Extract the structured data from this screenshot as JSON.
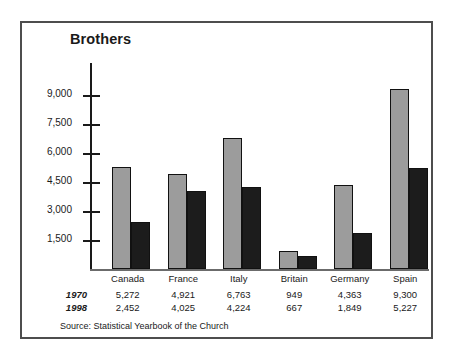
{
  "chart_data": {
    "type": "bar",
    "title": "Brothers",
    "xlabel": "",
    "ylabel": "",
    "categories": [
      "Canada",
      "France",
      "Italy",
      "Britain",
      "Germany",
      "Spain"
    ],
    "series": [
      {
        "name": "1970",
        "values": [
          5272,
          4921,
          6763,
          949,
          4363,
          9300
        ]
      },
      {
        "name": "1998",
        "values": [
          2452,
          4025,
          4224,
          667,
          1849,
          5227
        ]
      }
    ],
    "value_labels": {
      "1970": [
        "5,272",
        "4,921",
        "6,763",
        "949",
        "4,363",
        "9,300"
      ],
      "1998": [
        "2,452",
        "4,025",
        "4,224",
        "667",
        "1,849",
        "5,227"
      ]
    },
    "yticks": [
      1500,
      3000,
      4500,
      6000,
      7500,
      9000
    ],
    "ytick_labels": [
      "1,500",
      "3,000",
      "4,500",
      "6,000",
      "7,500",
      "9,000"
    ],
    "ylim": [
      0,
      9800
    ],
    "grid": false,
    "legend": "none",
    "series_colors": {
      "1970": "#9c9c9c",
      "1998": "#1c1c1c"
    },
    "source_note": "Source: Statistical Yearbook of the Church"
  },
  "figure": {
    "border_color": "#4d4d4d",
    "background": "#ffffff"
  }
}
